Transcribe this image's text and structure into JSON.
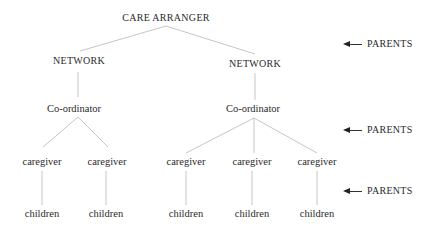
{
  "diagram": {
    "root": {
      "label": "CARE ARRANGER"
    },
    "networks": [
      {
        "label": "NETWORK",
        "coordinator": "Co-ordinator",
        "caregivers": [
          {
            "label": "caregiver",
            "child": "children"
          },
          {
            "label": "caregiver",
            "child": "children"
          }
        ]
      },
      {
        "label": "NETWORK",
        "coordinator": "Co-ordinator",
        "caregivers": [
          {
            "label": "caregiver",
            "child": "children"
          },
          {
            "label": "caregiver",
            "child": "children"
          },
          {
            "label": "caregiver",
            "child": "children"
          }
        ]
      }
    ],
    "annotations": [
      {
        "label": "PARENTS",
        "arrow": "left-arrow"
      },
      {
        "label": "PARENTS",
        "arrow": "left-arrow"
      },
      {
        "label": "PARENTS",
        "arrow": "left-arrow"
      }
    ],
    "line_color": "#b5b5b5"
  }
}
